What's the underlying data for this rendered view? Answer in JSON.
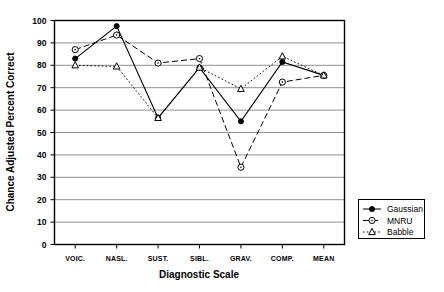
{
  "chart_data": {
    "type": "line",
    "title": "",
    "xlabel": "Diagnostic Scale",
    "ylabel": "Chance Adjusted Percent Correct",
    "categories": [
      "VOIC.",
      "NASL.",
      "SUST.",
      "SIBL.",
      "GRAV.",
      "COMP.",
      "MEAN"
    ],
    "ylim": [
      0,
      100
    ],
    "yticks": [
      0,
      10,
      20,
      30,
      40,
      50,
      60,
      70,
      80,
      90,
      100
    ],
    "grid": "horizontal",
    "legend_position": "right-outside",
    "series": [
      {
        "name": "Gaussian",
        "values": [
          83,
          97.5,
          56.5,
          79,
          55,
          81.5,
          75.5
        ],
        "line_style": "solid",
        "marker": "filled-circle",
        "color": "#000000"
      },
      {
        "name": "MNRU",
        "values": [
          87,
          93.5,
          81,
          83,
          34.5,
          72.5,
          75.5
        ],
        "line_style": "dashed",
        "marker": "open-circle",
        "color": "#000000"
      },
      {
        "name": "Babble",
        "values": [
          80,
          79.5,
          56.5,
          79,
          69.5,
          84,
          75.5
        ],
        "line_style": "dotted",
        "marker": "open-triangle",
        "color": "#000000"
      }
    ]
  },
  "legend": {
    "entries": [
      {
        "label": "Gaussian"
      },
      {
        "label": "MNRU"
      },
      {
        "label": "Babble"
      }
    ]
  },
  "axes": {
    "y_tick_labels": [
      "0",
      "10",
      "20",
      "30",
      "40",
      "50",
      "60",
      "70",
      "80",
      "90",
      "100"
    ],
    "x_tick_labels": [
      "VOIC.",
      "NASL.",
      "SUST.",
      "SIBL.",
      "GRAV.",
      "COMP.",
      "MEAN"
    ],
    "y_axis_title": "Chance Adjusted Percent Correct",
    "x_axis_title": "Diagnostic Scale"
  }
}
